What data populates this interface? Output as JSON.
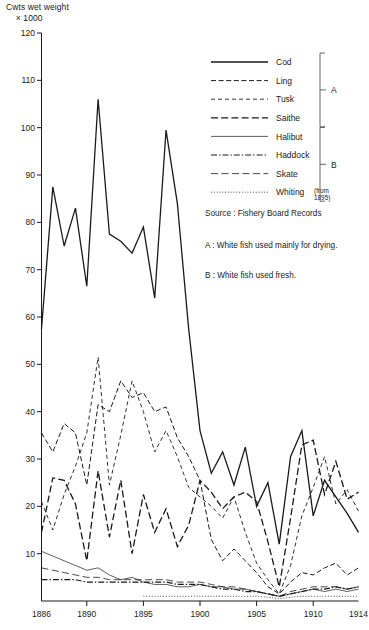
{
  "axis_title": "Cwts wet weight\n    × 1000",
  "notes": {
    "source": "Source : Fishery Board Records",
    "note_a": "A : White fish used mainly for drying.",
    "note_b": "B : White fish used fresh."
  },
  "brackets": [
    {
      "label": "A",
      "series_from": 0,
      "series_to": 3
    },
    {
      "label": "B",
      "series_from": 4,
      "series_to": 7
    }
  ],
  "legend": {
    "whiting_sup_line1": "(from",
    "whiting_sup_line2": "1895)"
  },
  "chart_data": {
    "type": "line",
    "title": "",
    "xlabel": "",
    "ylabel": "Cwts wet weight × 1000",
    "xlim": [
      1886,
      1914
    ],
    "ylim": [
      0,
      120
    ],
    "ytick_step": 10,
    "yticks": [
      0,
      10,
      20,
      30,
      40,
      50,
      60,
      70,
      80,
      90,
      100,
      110,
      120
    ],
    "ytick_labels": [
      "",
      "10",
      "20",
      "30",
      "40",
      "50",
      "60",
      "70",
      "80",
      "90",
      "100",
      "110",
      "120"
    ],
    "xticks": [
      1886,
      1890,
      1895,
      1900,
      1905,
      1910,
      1914
    ],
    "xtick_labels": [
      "1886",
      "1890",
      "1895",
      "1900",
      "1905",
      "1910",
      "1914"
    ],
    "grid": false,
    "legend_position": "upper-right",
    "x": [
      1886,
      1887,
      1888,
      1889,
      1890,
      1891,
      1892,
      1893,
      1894,
      1895,
      1896,
      1897,
      1898,
      1899,
      1900,
      1901,
      1902,
      1903,
      1904,
      1905,
      1906,
      1907,
      1908,
      1909,
      1910,
      1911,
      1912,
      1913,
      1914
    ],
    "series": [
      {
        "name": "Cod",
        "style": "solid",
        "width": 1.3,
        "values": [
          57.5,
          87.5,
          75.0,
          83.0,
          66.5,
          106.0,
          77.5,
          76.0,
          73.5,
          79.0,
          64.0,
          99.5,
          84.0,
          57.5,
          36.0,
          27.0,
          31.5,
          24.5,
          32.5,
          20.0,
          25.0,
          12.0,
          30.5,
          36.0,
          18.0,
          25.5,
          22.0,
          18.5,
          14.5
        ]
      },
      {
        "name": "Ling",
        "style": "dashed",
        "width": 1.0,
        "values": [
          35.5,
          31.5,
          37.5,
          35.5,
          24.5,
          41.5,
          40.0,
          46.5,
          43.0,
          44.0,
          40.0,
          41.0,
          34.5,
          30.5,
          25.5,
          13.0,
          8.5,
          11.0,
          8.5,
          6.0,
          3.0,
          1.5,
          4.0,
          6.0,
          5.5,
          7.0,
          8.0,
          5.5,
          7.0
        ]
      },
      {
        "name": "Tusk",
        "style": "finedash",
        "width": 0.9,
        "values": [
          21.0,
          15.0,
          22.5,
          28.5,
          35.5,
          51.5,
          24.5,
          35.0,
          46.5,
          40.0,
          31.5,
          36.0,
          30.5,
          24.0,
          22.0,
          20.0,
          17.5,
          22.0,
          14.5,
          8.0,
          4.5,
          1.5,
          7.5,
          18.0,
          24.0,
          30.5,
          20.5,
          23.5,
          19.0
        ]
      },
      {
        "name": "Saithe",
        "style": "longdash",
        "width": 1.3,
        "values": [
          14.5,
          26.0,
          25.5,
          20.5,
          8.5,
          27.5,
          13.5,
          25.5,
          10.0,
          22.5,
          14.5,
          19.5,
          11.5,
          16.0,
          25.5,
          23.0,
          19.5,
          22.0,
          23.0,
          21.0,
          12.5,
          3.0,
          17.5,
          33.0,
          34.0,
          22.5,
          29.5,
          21.5,
          23.0
        ]
      },
      {
        "name": "Halibut",
        "style": "thin",
        "width": 0.7,
        "values": [
          10.5,
          9.5,
          8.5,
          7.5,
          6.5,
          7.0,
          5.5,
          4.5,
          5.0,
          4.0,
          3.5,
          3.5,
          3.0,
          3.0,
          3.5,
          3.0,
          3.0,
          2.5,
          2.5,
          2.0,
          1.5,
          1.0,
          1.5,
          2.0,
          2.5,
          2.0,
          2.5,
          2.0,
          2.5
        ]
      },
      {
        "name": "Haddock",
        "style": "dashdot",
        "width": 1.2,
        "values": [
          4.5,
          4.5,
          4.5,
          4.5,
          4.0,
          4.0,
          4.0,
          4.0,
          4.0,
          4.0,
          4.0,
          4.0,
          3.5,
          3.5,
          3.5,
          3.0,
          2.5,
          2.5,
          2.0,
          2.0,
          1.5,
          1.0,
          1.5,
          2.0,
          2.5,
          2.5,
          3.0,
          2.5,
          3.0
        ]
      },
      {
        "name": "Skate",
        "style": "skatedash",
        "width": 0.8,
        "values": [
          7.0,
          6.5,
          6.0,
          5.5,
          5.0,
          5.0,
          4.5,
          4.5,
          4.5,
          4.5,
          4.5,
          4.5,
          4.0,
          4.0,
          4.0,
          3.5,
          3.0,
          3.0,
          2.5,
          2.0,
          1.5,
          1.0,
          2.0,
          2.5,
          3.0,
          3.0,
          3.0,
          2.5,
          3.0
        ]
      },
      {
        "name": "Whiting",
        "style": "dotted",
        "width": 0.8,
        "values": [
          null,
          null,
          null,
          null,
          null,
          null,
          null,
          null,
          null,
          1.0,
          1.0,
          1.0,
          1.0,
          1.0,
          1.0,
          1.0,
          1.0,
          1.0,
          1.0,
          1.0,
          0.8,
          0.5,
          0.8,
          1.0,
          1.0,
          1.0,
          1.0,
          1.0,
          1.0
        ]
      }
    ]
  }
}
